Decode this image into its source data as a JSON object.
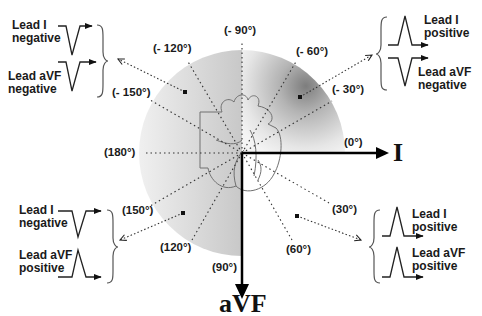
{
  "diagram": {
    "center": {
      "x": 242,
      "y": 153
    },
    "colors": {
      "axis": "#000000",
      "text": "#1a1a1a",
      "circle_light": "#f2f2f2",
      "circle_dark": "#8a8a8a",
      "dotted": "#333333"
    },
    "axes": {
      "horizontal": {
        "label": "I",
        "angle_label": "(0°)"
      },
      "vertical": {
        "label": "aVF",
        "angle_label": "(90°)"
      }
    },
    "angle_labels": [
      {
        "text": "(- 90°)",
        "x": 224,
        "y": 31
      },
      {
        "text": "(- 120°)",
        "x": 155,
        "y": 48
      },
      {
        "text": "(- 60°)",
        "x": 296,
        "y": 52
      },
      {
        "text": "(- 150°)",
        "x": 113,
        "y": 92
      },
      {
        "text": "(- 30°)",
        "x": 332,
        "y": 90
      },
      {
        "text": "(180°)",
        "x": 104,
        "y": 143
      },
      {
        "text": "(0°)",
        "x": 345,
        "y": 137
      },
      {
        "text": "(150°)",
        "x": 123,
        "y": 206
      },
      {
        "text": "(30°)",
        "x": 332,
        "y": 206
      },
      {
        "text": "(120°)",
        "x": 160,
        "y": 243
      },
      {
        "text": "(60°)",
        "x": 286,
        "y": 243
      },
      {
        "text": "(90°)",
        "x": 213,
        "y": 261
      }
    ],
    "quadrants": [
      {
        "name": "upper-left",
        "lead_i": {
          "label_line1": "Lead I",
          "label_line2": "negative"
        },
        "lead_avf": {
          "label_line1": "Lead aVF",
          "label_line2": "negative"
        }
      },
      {
        "name": "upper-right",
        "lead_i": {
          "label_line1": "Lead I",
          "label_line2": "positive"
        },
        "lead_avf": {
          "label_line1": "Lead aVF",
          "label_line2": "negative"
        }
      },
      {
        "name": "lower-left",
        "lead_i": {
          "label_line1": "Lead I",
          "label_line2": "negative"
        },
        "lead_avf": {
          "label_line1": "Lead aVF",
          "label_line2": "positive"
        }
      },
      {
        "name": "lower-right",
        "lead_i": {
          "label_line1": "Lead I",
          "label_line2": "positive"
        },
        "lead_avf": {
          "label_line1": "Lead aVF",
          "label_line2": "positive"
        }
      }
    ]
  }
}
